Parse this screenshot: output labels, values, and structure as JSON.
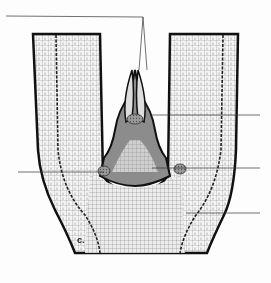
{
  "figure": {
    "caption": "c.",
    "colors": {
      "outline": "#111111",
      "cell_mesh": "#6a6a6a",
      "meristem_shade": "#8a8a8a",
      "leader_line": "#333333",
      "background": "#fdfdfd"
    },
    "leader_lines": [
      {
        "id": "apex",
        "side": "top-left"
      },
      {
        "id": "leaf-primordium",
        "side": "right"
      },
      {
        "id": "axillary-bud-left",
        "side": "left"
      },
      {
        "id": "axillary-bud-right",
        "side": "right"
      },
      {
        "id": "vascular-strand",
        "side": "right"
      }
    ]
  }
}
